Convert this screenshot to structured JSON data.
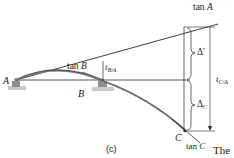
{
  "figure": {
    "caption": "(c)",
    "trailing_text": "The"
  },
  "labels": {
    "point_a": "A",
    "point_b": "B",
    "point_c": "C",
    "tan_a": {
      "prefix": "tan ",
      "var": "A"
    },
    "tan_b": {
      "prefix": "tan ",
      "var": "B"
    },
    "tan_c": {
      "prefix": "tan ",
      "var": "C"
    },
    "t_b_a": {
      "main": "t",
      "sub": "B/A"
    },
    "t_c_a": {
      "main": "t",
      "sub": "C/A"
    },
    "delta_prime": "Δ'",
    "delta_c": {
      "main": "Δ",
      "sub": "C"
    }
  },
  "colors": {
    "line": "#2a2a2a",
    "beam": "#555555",
    "support": "#8a8a8a",
    "ground": "#b5b5b5"
  }
}
